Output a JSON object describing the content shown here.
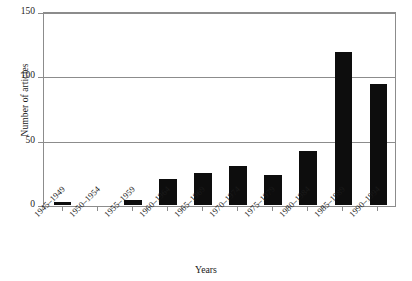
{
  "chart_data": {
    "type": "bar",
    "title": "",
    "xlabel": "Years",
    "ylabel": "Number of articles",
    "ylim": [
      0,
      150
    ],
    "yticks": [
      0,
      50,
      100,
      150
    ],
    "ytick_labels": [
      "0",
      "50",
      "100",
      "150"
    ],
    "grid": true,
    "legend": "none",
    "bar_color": "#0d0d0d",
    "axis_color": "#8c8c8c",
    "categories": [
      "1945–1949",
      "1950–1954",
      "1955–1959",
      "1960–1964",
      "1965–1969",
      "1970–1974",
      "1975–1979",
      "1980–1984",
      "1985–1989",
      "1990–1994"
    ],
    "values": [
      2,
      0,
      4,
      20,
      25,
      30,
      23,
      42,
      119,
      94
    ]
  },
  "caption": {
    "text": ""
  }
}
